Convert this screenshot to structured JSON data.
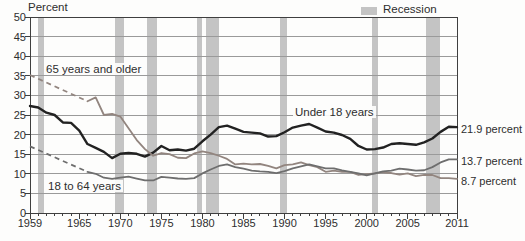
{
  "chart_data": {
    "type": "line",
    "title": "",
    "ylabel": "Percent",
    "x_range": [
      1959,
      2011
    ],
    "y_range": [
      0,
      50
    ],
    "y_tick_step": 5,
    "x_tick_labels": [
      1959,
      1965,
      1970,
      1975,
      1980,
      1985,
      1990,
      1995,
      2000,
      2005,
      2011
    ],
    "grid": true,
    "legend": {
      "label": "Recession",
      "position": "top-right"
    },
    "colors": {
      "recession_band": "#c4c4c4",
      "grid": "#9a9a9a",
      "border": "#3f3f3f",
      "text": "#2e2e2e"
    },
    "series": [
      {
        "name": "Under 18 years",
        "color": "#222222",
        "line_width": 2.4,
        "end_label": "21.9 percent",
        "start_year": 1959,
        "values": [
          27.3,
          26.9,
          25.6,
          25.0,
          23.1,
          23.0,
          21.0,
          17.6,
          16.6,
          15.6,
          14.0,
          15.1,
          15.3,
          15.1,
          14.4,
          15.4,
          17.1,
          16.0,
          16.2,
          15.9,
          16.4,
          18.3,
          20.0,
          21.9,
          22.3,
          21.5,
          20.7,
          20.5,
          20.3,
          19.5,
          19.6,
          20.6,
          21.8,
          22.3,
          22.7,
          21.8,
          20.8,
          20.5,
          19.9,
          18.9,
          17.1,
          16.2,
          16.3,
          16.7,
          17.6,
          17.8,
          17.6,
          17.4,
          18.0,
          19.0,
          20.7,
          22.0,
          21.9
        ]
      },
      {
        "name": "65 years and older",
        "color": "#92857f",
        "line_width": 1.8,
        "end_label": "8.7 percent",
        "dashed_anchor": {
          "year": 1959,
          "value": 35.2
        },
        "start_year": 1966,
        "values": [
          28.5,
          29.5,
          25.0,
          25.3,
          24.6,
          21.6,
          18.6,
          16.3,
          14.6,
          15.3,
          15.0,
          14.1,
          14.0,
          15.2,
          15.7,
          15.3,
          14.6,
          13.8,
          12.4,
          12.6,
          12.4,
          12.5,
          12.0,
          11.4,
          12.2,
          12.4,
          12.9,
          12.2,
          11.7,
          10.5,
          10.8,
          10.5,
          10.5,
          9.7,
          9.9,
          10.1,
          10.4,
          10.2,
          9.8,
          10.1,
          9.4,
          9.7,
          9.7,
          8.9,
          8.9,
          8.7
        ]
      },
      {
        "name": "18 to 64 years",
        "color": "#6e6e6e",
        "line_width": 1.8,
        "end_label": "13.7 percent",
        "dashed_anchor": {
          "year": 1959,
          "value": 17.0
        },
        "start_year": 1966,
        "values": [
          10.5,
          10.0,
          9.0,
          8.7,
          9.0,
          9.3,
          8.8,
          8.3,
          8.3,
          9.2,
          9.0,
          8.8,
          8.7,
          8.9,
          10.1,
          11.1,
          12.0,
          12.4,
          11.7,
          11.3,
          10.8,
          10.6,
          10.5,
          10.2,
          10.7,
          11.4,
          11.9,
          12.4,
          11.9,
          11.4,
          11.4,
          10.9,
          10.5,
          10.1,
          9.6,
          10.1,
          10.6,
          10.8,
          11.3,
          11.1,
          10.8,
          10.9,
          11.7,
          12.9,
          13.7,
          13.7
        ]
      }
    ],
    "recessions": [
      [
        1960.0,
        1960.7
      ],
      [
        1969.4,
        1970.4
      ],
      [
        1973.2,
        1974.5
      ],
      [
        1979.3,
        1979.9
      ],
      [
        1980.4,
        1982.0
      ],
      [
        1989.5,
        1990.3
      ],
      [
        2000.7,
        2001.4
      ],
      [
        2007.2,
        2008.9
      ]
    ]
  }
}
